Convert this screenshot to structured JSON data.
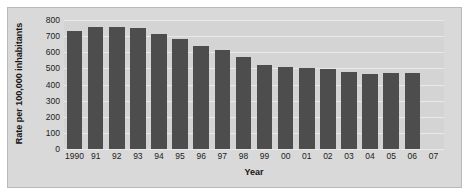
{
  "chart_data": {
    "type": "bar",
    "title": "",
    "xlabel": "Year",
    "ylabel": "Rate per 100,000 inhabitants",
    "categories": [
      "1990",
      "91",
      "92",
      "93",
      "94",
      "95",
      "96",
      "97",
      "98",
      "99",
      "00",
      "01",
      "02",
      "03",
      "04",
      "05",
      "06",
      "07"
    ],
    "values": [
      731,
      758,
      758,
      751,
      714,
      685,
      637,
      611,
      568,
      523,
      507,
      504,
      494,
      476,
      465,
      469,
      474,
      null
    ],
    "ylim": [
      0,
      800
    ],
    "yticks": [
      0,
      100,
      200,
      300,
      400,
      500,
      600,
      700,
      800
    ],
    "ytick_labels": [
      "0",
      "100",
      "200",
      "300",
      "400",
      "500",
      "600",
      "700",
      "800"
    ],
    "grid": true,
    "legend": null,
    "bar_color": "#4d4d4d",
    "plot_background": "#d4d4d4",
    "panel_background": "#d9d9d9",
    "gridline_color": "#e9e9e9",
    "text_color": "#1c1c1c",
    "note": "Final category 07 has a tick label but no bar plotted"
  }
}
